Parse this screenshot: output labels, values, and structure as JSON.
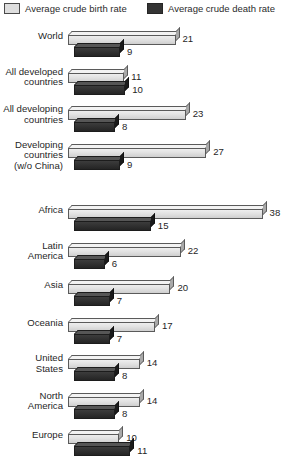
{
  "legend": {
    "birth": {
      "label": "Average crude birth rate",
      "swatch": "light-swatch",
      "color": "#dedede"
    },
    "death": {
      "label": "Average crude death rate",
      "swatch": "dark-swatch",
      "color": "#343434"
    }
  },
  "chart_data": {
    "type": "bar",
    "orientation": "horizontal",
    "title": "",
    "subtitle": "",
    "xlabel": "",
    "ylabel": "",
    "xlim": [
      0,
      38
    ],
    "grid": false,
    "legend_position": "top",
    "categories": [
      "World",
      "All developed countries",
      "All developing countries",
      "Developing countries (w/o China)",
      "Africa",
      "Latin America",
      "Asia",
      "Oceania",
      "United States",
      "North America",
      "Europe"
    ],
    "series": [
      {
        "name": "Average crude birth rate",
        "values": [
          21,
          11,
          23,
          27,
          38,
          22,
          20,
          17,
          14,
          14,
          10
        ]
      },
      {
        "name": "Average crude death rate",
        "values": [
          9,
          10,
          8,
          9,
          15,
          6,
          7,
          7,
          8,
          8,
          11
        ]
      }
    ],
    "groups": [
      {
        "name": "aggregate-group",
        "rows": [
          {
            "label_lines": [
              "World"
            ],
            "birth": 21,
            "death": 9
          },
          {
            "label_lines": [
              "All developed",
              "countries"
            ],
            "birth": 11,
            "death": 10
          },
          {
            "label_lines": [
              "All developing",
              "countries"
            ],
            "birth": 23,
            "death": 8
          },
          {
            "label_lines": [
              "Developing",
              "countries",
              "(w/o China)"
            ],
            "birth": 27,
            "death": 9
          }
        ]
      },
      {
        "name": "region-group",
        "rows": [
          {
            "label_lines": [
              "Africa"
            ],
            "birth": 38,
            "death": 15
          },
          {
            "label_lines": [
              "Latin",
              "America"
            ],
            "birth": 22,
            "death": 6
          },
          {
            "label_lines": [
              "Asia"
            ],
            "birth": 20,
            "death": 7
          },
          {
            "label_lines": [
              "Oceania"
            ],
            "birth": 17,
            "death": 7
          },
          {
            "label_lines": [
              "United",
              "States"
            ],
            "birth": 14,
            "death": 8
          },
          {
            "label_lines": [
              "North",
              "America"
            ],
            "birth": 14,
            "death": 8
          },
          {
            "label_lines": [
              "Europe"
            ],
            "birth": 10,
            "death": 11
          }
        ]
      }
    ]
  }
}
